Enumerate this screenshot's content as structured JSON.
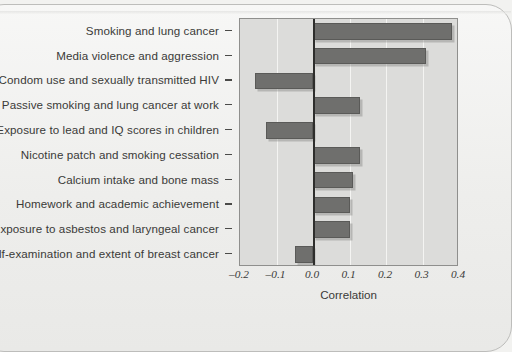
{
  "chart_data": {
    "type": "bar",
    "orientation": "horizontal",
    "title": "",
    "xlabel": "Correlation",
    "ylabel": "",
    "xlim": [
      -0.2,
      0.4
    ],
    "xticks": [
      -0.2,
      -0.1,
      0.0,
      0.1,
      0.2,
      0.3,
      0.4
    ],
    "xtick_labels": [
      "–0.2",
      "–0.1",
      "0.0",
      "0.1",
      "0.2",
      "0.3",
      "0.4"
    ],
    "grid": true,
    "grid_axis": "x",
    "legend": null,
    "zero_line": true,
    "bar_color": "#6f6f6d",
    "plot_background": "#dcdcda",
    "categories": [
      "Smoking and lung cancer",
      "Media violence and aggression",
      "Condom use and sexually transmitted HIV",
      "Passive smoking and lung cancer at work",
      "Exposure to lead and IQ scores in children",
      "Nicotine patch and smoking cessation",
      "Calcium intake and bone mass",
      "Homework and academic achievement",
      "Exposure to asbestos and laryngeal cancer",
      "Self-examination and extent of breast cancer"
    ],
    "values": [
      0.38,
      0.31,
      -0.16,
      0.13,
      -0.13,
      0.13,
      0.11,
      0.1,
      0.1,
      -0.05
    ]
  }
}
